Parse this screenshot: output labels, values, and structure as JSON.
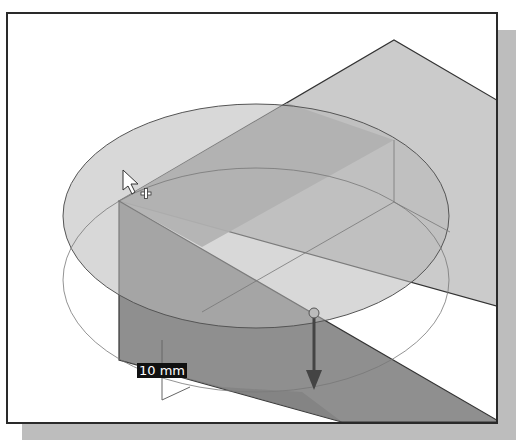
{
  "viewport": {
    "title": "3D modeling viewport - extrude preview",
    "dimension_label": "10 mm",
    "colors": {
      "background": "#ffffff",
      "frame": "#2a2a2a",
      "shadow": "#bdbdbd",
      "block_top": "#c9c9c9",
      "block_front": "#8e8e8e",
      "sketch_circle": "#b5b5b5",
      "arrow": "#555555"
    },
    "icons": [
      "cursor-arrow-icon",
      "crosshair-plus-icon",
      "extrude-direction-arrow-icon",
      "drag-handle-sphere-icon"
    ]
  }
}
